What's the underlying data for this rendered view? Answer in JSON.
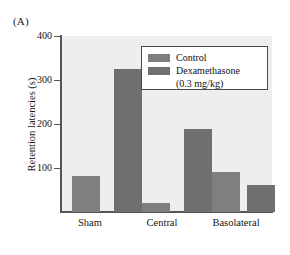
{
  "panel": {
    "label": "(A)"
  },
  "chart_data": {
    "type": "bar",
    "title": "",
    "xlabel": "",
    "ylabel": "Retention latencies (s)",
    "categories": [
      "Sham",
      "Central",
      "Basolateral"
    ],
    "series": [
      {
        "name": "Control",
        "values": [
          82,
          20,
          90
        ],
        "color": "#7f7f7f"
      },
      {
        "name": "Dexamethasone (0.3 mg/kg)",
        "values": [
          325,
          188,
          62
        ],
        "color": "#6f6f6f"
      }
    ],
    "ylim": [
      0,
      400
    ],
    "yticks": [
      100,
      200,
      300,
      400
    ],
    "ytick_labels": [
      "100",
      "200",
      "300",
      "400"
    ],
    "grid": false,
    "legend_position": "top-right",
    "plot_background": "#efeeec",
    "axis_color": "#555555"
  },
  "legend": {
    "entries": [
      {
        "label": "Control",
        "swatch": "legend-swatch-control"
      },
      {
        "label": "Dexamethasone",
        "swatch": "legend-swatch-dexamethasone"
      }
    ],
    "sublabel": "(0.3 mg/kg)"
  }
}
